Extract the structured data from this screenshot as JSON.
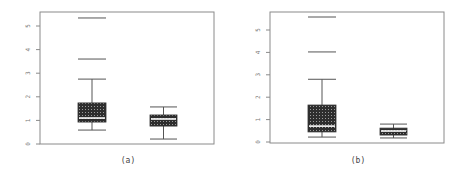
{
  "chart_data": [
    {
      "type": "box",
      "title": "",
      "caption": "(a)",
      "xlabel": "",
      "ylabel": "",
      "ylim": [
        0,
        5.5
      ],
      "yticks": [
        0,
        1,
        2,
        3,
        4,
        5
      ],
      "ytick_labels": [
        "0",
        "1",
        "2",
        "3",
        "4",
        "5"
      ],
      "grid": false,
      "categories": [
        "group 1",
        "group 2"
      ],
      "series": [
        {
          "name": "group 1",
          "lower_whisker": 0.59,
          "q1": 0.93,
          "median": 1.1,
          "q3": 1.74,
          "upper_whisker": 2.75,
          "outliers": [
            3.6,
            5.34
          ]
        },
        {
          "name": "group 2",
          "lower_whisker": 0.21,
          "q1": 0.76,
          "median": 1.06,
          "q3": 1.23,
          "upper_whisker": 1.57,
          "outliers": []
        }
      ]
    },
    {
      "type": "box",
      "title": "",
      "caption": "(b)",
      "xlabel": "",
      "ylabel": "",
      "ylim": [
        0,
        5.8
      ],
      "yticks": [
        0,
        1,
        2,
        3,
        4,
        5
      ],
      "ytick_labels": [
        "0",
        "1",
        "2",
        "3",
        "4",
        "5"
      ],
      "grid": false,
      "categories": [
        "group 1",
        "group 2"
      ],
      "series": [
        {
          "name": "group 1",
          "lower_whisker": 0.22,
          "q1": 0.45,
          "median": 0.71,
          "q3": 1.65,
          "upper_whisker": 2.8,
          "outliers": [
            4.02,
            5.58
          ]
        },
        {
          "name": "group 2",
          "lower_whisker": 0.18,
          "q1": 0.31,
          "median": 0.49,
          "q3": 0.62,
          "upper_whisker": 0.8,
          "outliers": []
        }
      ]
    }
  ],
  "layout": {
    "panels": [
      {
        "frame": {
          "left": 40,
          "top": 12,
          "right": 214,
          "bottom": 144
        },
        "y0_px": 144,
        "px_per_unit": 23.6,
        "box_x": [
          [
            78,
            106
          ],
          [
            150,
            177
          ]
        ],
        "caption_x": 128
      },
      {
        "frame": {
          "left": 270,
          "top": 12,
          "right": 444,
          "bottom": 143
        },
        "y0_px": 142,
        "px_per_unit": 22.4,
        "box_x": [
          [
            308,
            336
          ],
          [
            380,
            407
          ]
        ],
        "caption_x": 358
      }
    ],
    "caption_y": 163,
    "colors": {
      "frame": "#8a8a8a",
      "box_fill": "#3a3a3a",
      "median": "#ffffff",
      "whisker": "#555555",
      "text": "#777777"
    }
  }
}
